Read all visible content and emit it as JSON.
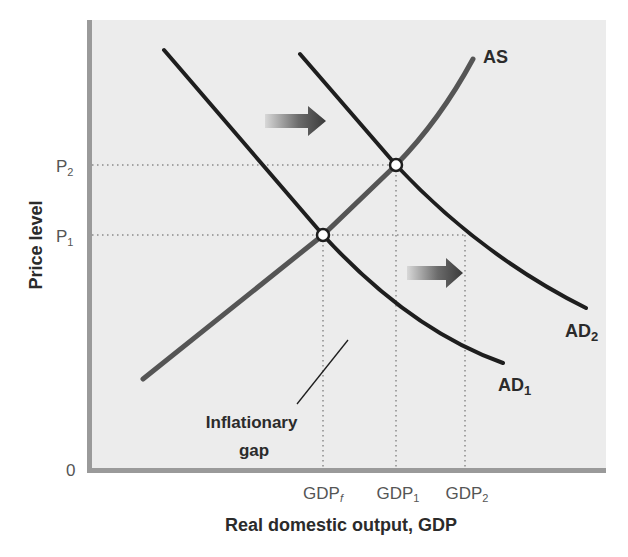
{
  "chart_data": {
    "type": "line",
    "title": "",
    "xlabel": "Real domestic output, GDP",
    "ylabel": "Price level",
    "origin_label": "0",
    "x_ticks": [
      {
        "base": "GDP",
        "sub": "f",
        "italic_sub": true,
        "x": 323
      },
      {
        "base": "GDP",
        "sub": "1",
        "italic_sub": false,
        "x": 396
      },
      {
        "base": "GDP",
        "sub": "2",
        "italic_sub": false,
        "x": 465
      }
    ],
    "y_ticks": [
      {
        "base": "P",
        "sub": "2",
        "y": 165
      },
      {
        "base": "P",
        "sub": "1",
        "y": 235
      }
    ],
    "series": [
      {
        "name": "AD1",
        "label_base": "AD",
        "label_sub": "1",
        "color": "#1e1e1e",
        "path": "M164,50 L323,235 Q410,330 503,363",
        "label_pos": [
          498,
          391
        ]
      },
      {
        "name": "AD2",
        "label_base": "AD",
        "label_sub": "2",
        "color": "#1e1e1e",
        "path": "M300,54 L396,165 Q480,255 586,308",
        "label_pos": [
          565,
          337
        ]
      },
      {
        "name": "AS",
        "label_base": "AS",
        "label_sub": "",
        "color": "#555555",
        "path": "M143,379 L323,235 L396,165 Q440,120 473,59",
        "label_pos": [
          483,
          63
        ]
      }
    ],
    "equilibria": [
      {
        "name": "initial",
        "x": 323,
        "y": 235,
        "price": "P1",
        "output": "GDPf"
      },
      {
        "name": "new",
        "x": 396,
        "y": 165,
        "price": "P2",
        "output": "GDP1"
      }
    ],
    "shift_arrows": [
      {
        "from": [
          265,
          121
        ],
        "to": [
          326,
          121
        ],
        "direction": "right"
      },
      {
        "from": [
          407,
          273
        ],
        "to": [
          463,
          273
        ],
        "direction": "right"
      }
    ],
    "annotations": [
      {
        "text_line1": "Inflationary",
        "text_line2": "gap",
        "pointer_from": [
          297,
          404
        ],
        "pointer_to": [
          348,
          340
        ]
      }
    ],
    "grid": false,
    "legend": "none",
    "colors": {
      "plot_background": "#ececec",
      "axis": "#9a9a9a",
      "dotted_guides": "#8a8a8a"
    }
  }
}
